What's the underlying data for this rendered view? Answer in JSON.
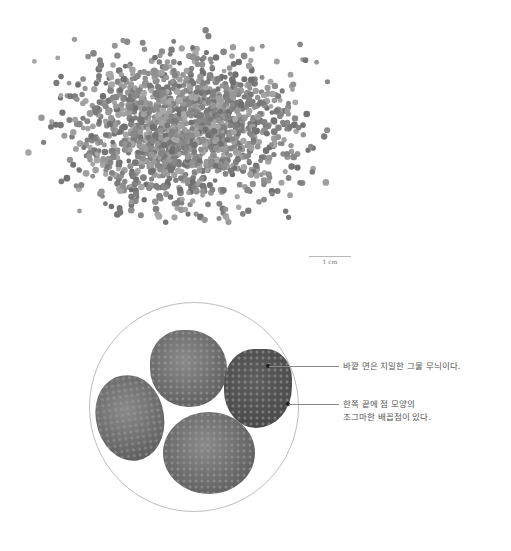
{
  "figure": {
    "top_panel": {
      "description": "scattered mass of small round seeds",
      "scale_bar_label": "1 cm"
    },
    "magnified_view": {
      "seed_count": 4,
      "callouts": [
        {
          "id": "surface",
          "text": "바깥 면은 치밀한 그물 무늬이다."
        },
        {
          "id": "hilum",
          "lines": [
            "한쪽 끝에 점 모양의",
            "조그마한 배꼽점이 있다."
          ]
        }
      ]
    },
    "colors": {
      "background": "#ffffff",
      "seed": "#6c6c6c",
      "line": "#8a8a8a",
      "text": "#555555"
    }
  }
}
